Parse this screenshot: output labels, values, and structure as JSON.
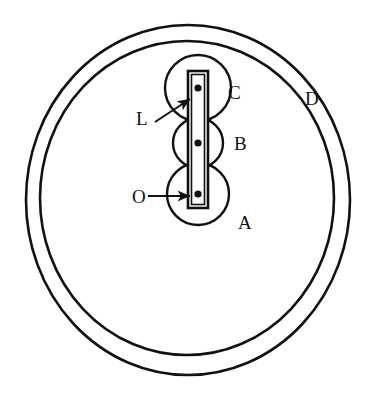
{
  "figure": {
    "background_color": "#ffffff",
    "stroke_color": "#111111",
    "fill_color": "#ffffff",
    "width": 386,
    "height": 405
  },
  "outer_ring": {
    "name": "D",
    "outer_ellipse": {
      "cx": 188,
      "cy": 200,
      "rx": 162,
      "ry": 175,
      "stroke_width": 2.6
    },
    "inner_ellipse": {
      "cx": 187,
      "cy": 198,
      "rx": 147,
      "ry": 157,
      "stroke_width": 2.6
    }
  },
  "rollers": [
    {
      "id": "A",
      "label": "A",
      "cx": 198,
      "cy": 194,
      "r": 31,
      "stroke_width": 2.4,
      "pivot": {
        "cx": 198,
        "cy": 194,
        "r": 3.6
      },
      "label_pos": {
        "x": 238,
        "y": 229
      }
    },
    {
      "id": "B",
      "label": "B",
      "cx": 198,
      "cy": 143,
      "r": 25,
      "stroke_width": 2.4,
      "pivot": {
        "cx": 198,
        "cy": 143,
        "r": 3.6
      },
      "label_pos": {
        "x": 234,
        "y": 150
      }
    },
    {
      "id": "C",
      "label": "C",
      "cx": 198,
      "cy": 88,
      "r": 33,
      "stroke_width": 2.4,
      "pivot": {
        "cx": 198,
        "cy": 88,
        "r": 3.6
      },
      "label_pos": {
        "x": 228,
        "y": 99
      }
    }
  ],
  "link_bar": {
    "id": "L",
    "label": "L",
    "x": 188,
    "y": 71,
    "width": 20,
    "height": 137,
    "stroke_width": 2.6,
    "inner_inset": 3.5
  },
  "labels": {
    "ring": {
      "text": "D",
      "x": 305,
      "y": 105
    },
    "link": {
      "text": "L",
      "x": 136,
      "y": 125
    },
    "origin": {
      "text": "O",
      "x": 132,
      "y": 203
    }
  },
  "leaders": [
    {
      "name": "leader-L",
      "from": {
        "x": 155,
        "y": 122
      },
      "to": {
        "x": 190,
        "y": 99
      },
      "stroke_width": 2.0,
      "arrow": true
    },
    {
      "name": "leader-O",
      "from": {
        "x": 148,
        "y": 196
      },
      "to": {
        "x": 190,
        "y": 196
      },
      "stroke_width": 2.0,
      "arrow": true
    }
  ]
}
